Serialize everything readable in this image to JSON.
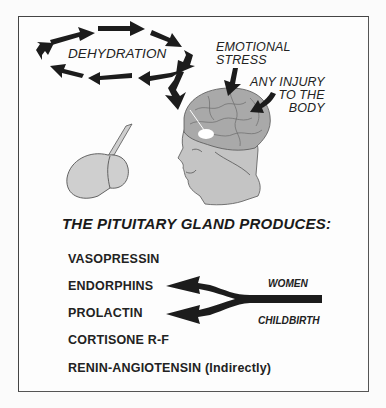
{
  "diagram": {
    "triggers": {
      "dehydration": "DEHYDRATION",
      "emotional_stress": [
        "EMOTIONAL",
        "STRESS"
      ],
      "any_injury": [
        "ANY INJURY",
        "TO THE",
        "BODY"
      ]
    },
    "title": "THE PITUITARY GLAND PRODUCES:",
    "hormones": [
      "VASOPRESSIN",
      "ENDORPHINS",
      "PROLACTIN",
      "CORTISONE R-F",
      "RENIN-ANGIOTENSIN (Indirectly)"
    ],
    "childbirth_arrow": {
      "top_label": "WOMEN",
      "bottom_label": "CHILDBIRTH",
      "targets": [
        "ENDORPHINS",
        "PROLACTIN"
      ]
    },
    "colors": {
      "arrow": "#1c1c1c",
      "brain_fill": "#a9a9a9",
      "face_fill": "#c4c4c4",
      "gland_fill": "#cfcfcf",
      "frame": "#444444"
    }
  }
}
